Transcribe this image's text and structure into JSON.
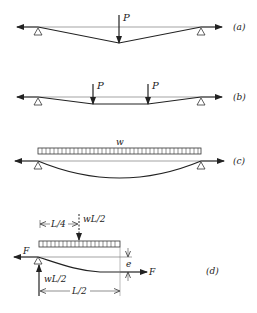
{
  "figures": [
    {
      "id": "a",
      "label": "(a)",
      "load": "P",
      "description": "single concentrated load at midspan, V-shaped deflection"
    },
    {
      "id": "b",
      "label": "(b)",
      "loads": [
        "P",
        "P"
      ],
      "description": "two concentrated loads, trapezoidal deflection"
    },
    {
      "id": "c",
      "label": "(c)",
      "load": "w",
      "description": "uniformly distributed load, parabolic deflection"
    },
    {
      "id": "d",
      "label": "(d)",
      "description": "half-span free body",
      "force_left": "F",
      "force_right": "F",
      "resultant_load": "wL/2",
      "reaction": "wL/2",
      "dim_load_position": "L/4",
      "dim_half_span": "L/2",
      "sag": "e"
    }
  ],
  "colors": {
    "line": "#222222",
    "axis": "#555555"
  }
}
